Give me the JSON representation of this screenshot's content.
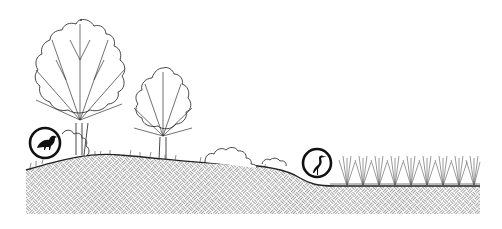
{
  "illustration": {
    "title": "",
    "elements": [
      {
        "name": "large-tree",
        "kind": "deciduous tree"
      },
      {
        "name": "medium-tree",
        "kind": "deciduous tree"
      },
      {
        "name": "shrub-left",
        "kind": "shrub"
      },
      {
        "name": "shrub-middle",
        "kind": "shrub"
      },
      {
        "name": "songbird-badge",
        "kind": "circled bird icon (perching bird)"
      },
      {
        "name": "heron-badge",
        "kind": "circled bird icon (heron)"
      },
      {
        "name": "reed-bed",
        "kind": "emergent wetland reeds",
        "count": 9
      },
      {
        "name": "soil-section",
        "kind": "basket-weave hatched ground"
      }
    ],
    "colors": {
      "line": "#222222",
      "hatch": "#9a9a9a",
      "background": "#ffffff"
    }
  }
}
